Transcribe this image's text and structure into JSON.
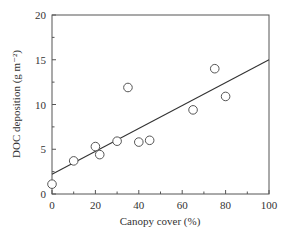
{
  "chart_data": {
    "type": "scatter",
    "title": "",
    "xlabel": "Canopy cover (%)",
    "ylabel": "DOC deposition (g m⁻²)",
    "xlim": [
      0,
      100
    ],
    "ylim": [
      0,
      20
    ],
    "xticks": [
      0,
      20,
      40,
      60,
      80,
      100
    ],
    "yticks": [
      0,
      5,
      10,
      15,
      20
    ],
    "grid": false,
    "legend": null,
    "series": [
      {
        "name": "observations",
        "marker": "open-circle",
        "points": [
          {
            "x": 0,
            "y": 1.1
          },
          {
            "x": 10,
            "y": 3.7
          },
          {
            "x": 20,
            "y": 5.3
          },
          {
            "x": 22,
            "y": 4.4
          },
          {
            "x": 30,
            "y": 5.9
          },
          {
            "x": 35,
            "y": 11.9
          },
          {
            "x": 40,
            "y": 5.8
          },
          {
            "x": 45,
            "y": 6.0
          },
          {
            "x": 65,
            "y": 9.4
          },
          {
            "x": 75,
            "y": 14.0
          },
          {
            "x": 80,
            "y": 10.9
          }
        ]
      },
      {
        "name": "linear fit",
        "type": "line",
        "points": [
          {
            "x": 0,
            "y": 2.2
          },
          {
            "x": 100,
            "y": 15.0
          }
        ]
      }
    ]
  }
}
